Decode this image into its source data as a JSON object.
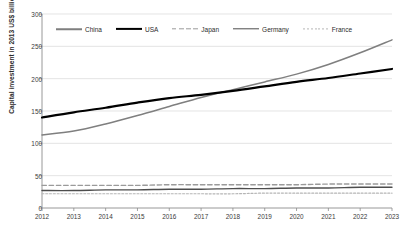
{
  "chart_data": {
    "type": "line",
    "title": "",
    "xlabel": "",
    "ylabel": "Capital investment in 2013 US$ billion",
    "x": [
      "2012",
      "2013",
      "2014",
      "2015",
      "2016",
      "2017",
      "2018",
      "2019",
      "2020",
      "2021",
      "2022",
      "2023"
    ],
    "xlim": [
      2012,
      2023
    ],
    "ylim": [
      0,
      300
    ],
    "yticks": [
      0,
      50,
      100,
      150,
      200,
      250,
      300
    ],
    "ytick_labels": [
      "0",
      "50",
      "100",
      "150",
      "200",
      "250",
      "300"
    ],
    "grid": true,
    "grid_axis": "y",
    "legend_position": "top-inside",
    "series": [
      {
        "name": "China",
        "color": "#7f7f7f",
        "style": "solid",
        "width": 1.5,
        "values": [
          113,
          119,
          130,
          143,
          157,
          171,
          183,
          195,
          207,
          222,
          240,
          260
        ]
      },
      {
        "name": "USA",
        "color": "#000000",
        "style": "solid",
        "width": 2.2,
        "values": [
          140,
          148,
          155,
          163,
          170,
          175,
          181,
          188,
          195,
          201,
          208,
          215
        ]
      },
      {
        "name": "Japan",
        "color": "#9a9a9a",
        "style": "dashed",
        "width": 1.4,
        "values": [
          35,
          35,
          35,
          35,
          36,
          36,
          36,
          36,
          36,
          37,
          37,
          37
        ]
      },
      {
        "name": "Germany",
        "color": "#4d4d4d",
        "style": "solid",
        "width": 1.4,
        "values": [
          27,
          27,
          28,
          28,
          29,
          29,
          30,
          30,
          31,
          31,
          32,
          32
        ]
      },
      {
        "name": "France",
        "color": "#b5b5b5",
        "style": "dotted",
        "width": 1.2,
        "values": [
          22,
          22,
          22,
          22,
          22,
          22,
          22,
          23,
          23,
          23,
          23,
          23
        ]
      }
    ]
  },
  "axis": {
    "y_title": "Capital investment in 2013 US$ billion",
    "y_tick_labels": [
      "0",
      "50",
      "100",
      "150",
      "200",
      "250",
      "300"
    ],
    "x_tick_labels": [
      "2012",
      "2013",
      "2014",
      "2015",
      "2016",
      "2017",
      "2018",
      "2019",
      "2020",
      "2021",
      "2022",
      "2023"
    ]
  },
  "legend": {
    "items": [
      {
        "label": "China"
      },
      {
        "label": "USA"
      },
      {
        "label": "Japan"
      },
      {
        "label": "Germany"
      },
      {
        "label": "France"
      }
    ]
  },
  "colors": {
    "background": "#ffffff",
    "grid": "#d9d9d9",
    "axis": "#8c8c8c",
    "text": "#3a3a3a"
  }
}
